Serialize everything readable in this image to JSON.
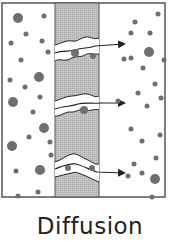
{
  "caption": "Diffusion",
  "colors": {
    "frame": "#555555",
    "membrane_fill": "#b8b8b8",
    "particle": "#6f6f6f",
    "channel_outline": "#333333",
    "background": "#ffffff"
  },
  "frame": {
    "x": 2,
    "y": 3,
    "w": 163,
    "h": 194
  },
  "membrane": {
    "x": 55,
    "y": 3,
    "w": 44,
    "h": 194
  },
  "channels": [
    {
      "y": 52,
      "label": "channel-top"
    },
    {
      "y": 108,
      "label": "channel-middle"
    },
    {
      "y": 168,
      "label": "channel-bottom"
    }
  ],
  "particles_left": [
    [
      18,
      18,
      5
    ],
    [
      44,
      16,
      2.5
    ],
    [
      26,
      34,
      2.5
    ],
    [
      11,
      43,
      2.5
    ],
    [
      42,
      41,
      2.5
    ],
    [
      48,
      52,
      2.5
    ],
    [
      21,
      60,
      2.5
    ],
    [
      39,
      77,
      5
    ],
    [
      10,
      80,
      2.5
    ],
    [
      25,
      87,
      2.5
    ],
    [
      40,
      97,
      2.5
    ],
    [
      13,
      102,
      5
    ],
    [
      33,
      112,
      2.5
    ],
    [
      44,
      128,
      5
    ],
    [
      12,
      146,
      5
    ],
    [
      29,
      137,
      2.5
    ],
    [
      50,
      142,
      2.5
    ],
    [
      51,
      155,
      2.5
    ],
    [
      16,
      171,
      2.5
    ],
    [
      40,
      170,
      5
    ],
    [
      18,
      196,
      2.5
    ],
    [
      38,
      192,
      2.5
    ],
    [
      33,
      205,
      5
    ]
  ],
  "particles_right": [
    [
      158,
      14,
      2.5
    ],
    [
      135,
      22,
      2.5
    ],
    [
      131,
      33,
      2.5
    ],
    [
      150,
      33,
      2.5
    ],
    [
      149,
      52,
      5
    ],
    [
      124,
      59,
      2.5
    ],
    [
      131,
      58,
      2.5
    ],
    [
      164,
      60,
      2.5
    ],
    [
      143,
      68,
      2.5
    ],
    [
      155,
      84,
      2.5
    ],
    [
      138,
      93,
      2.5
    ],
    [
      161,
      98,
      2.5
    ],
    [
      118,
      101,
      2.5
    ],
    [
      147,
      106,
      2.5
    ],
    [
      131,
      129,
      2.5
    ],
    [
      160,
      135,
      2.5
    ],
    [
      142,
      141,
      2.5
    ],
    [
      156,
      158,
      2.5
    ],
    [
      134,
      164,
      2.5
    ],
    [
      142,
      173,
      2.5
    ],
    [
      128,
      176,
      2.5
    ],
    [
      155,
      179,
      5
    ],
    [
      152,
      197,
      2.5
    ],
    [
      131,
      204,
      2.5
    ],
    [
      160,
      213,
      2.5
    ]
  ],
  "particles_in_channel": [
    [
      75,
      53,
      4
    ],
    [
      84,
      110,
      4
    ],
    [
      93,
      56,
      3
    ],
    [
      92,
      168,
      3
    ],
    [
      68,
      168,
      3
    ]
  ]
}
